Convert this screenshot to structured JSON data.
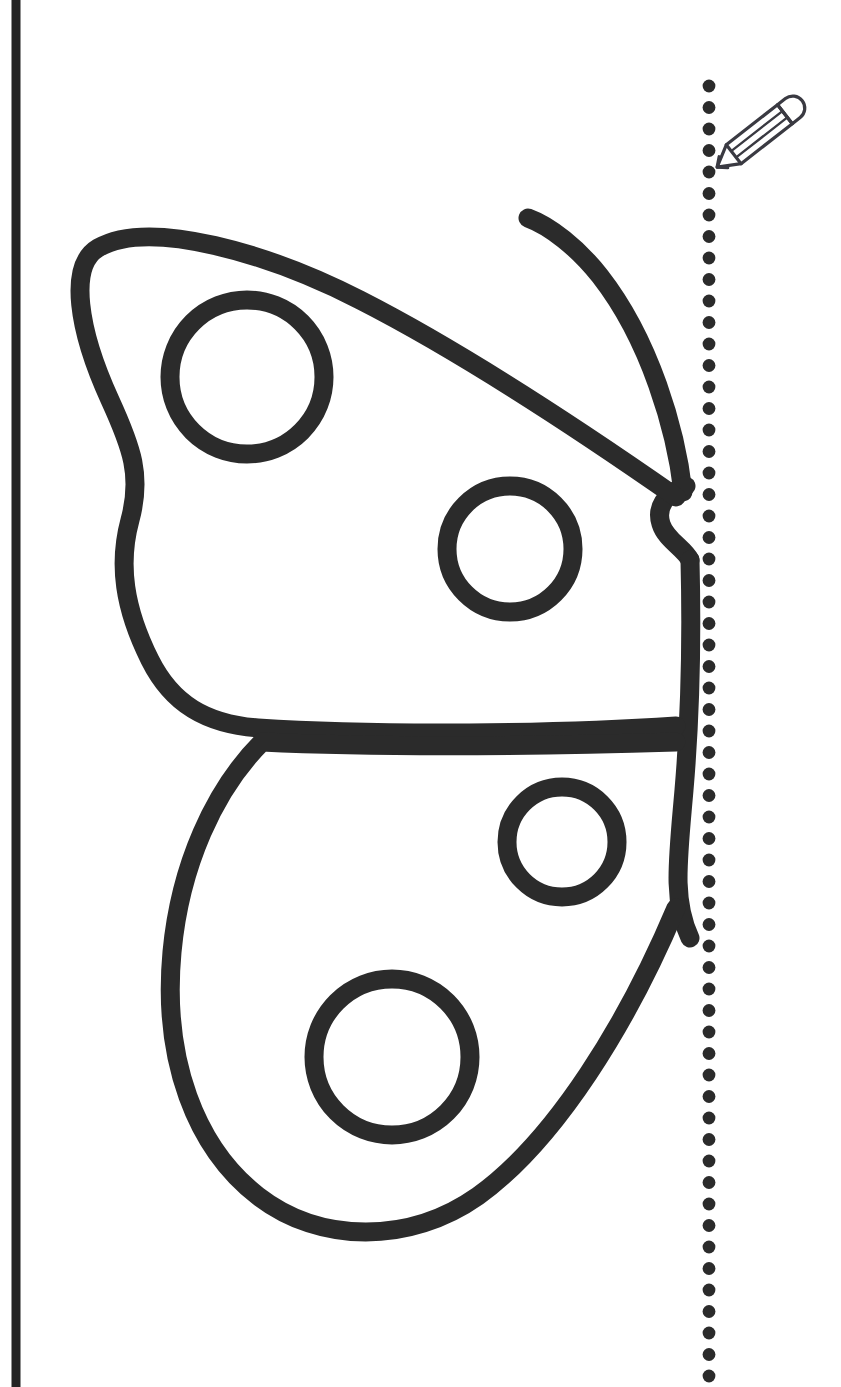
{
  "page": {
    "title": "Butterfly Symmetry Drawing Worksheet",
    "width": 841,
    "height": 1387,
    "background_color": "#ffffff",
    "ink_color": "#2b2b2b",
    "accent_color": "#3a3a42"
  },
  "margin_rule": {
    "name": "left-margin-rule",
    "x": 16,
    "y_start": 0,
    "y_end": 1387,
    "stroke_width": 9,
    "color": "#232323"
  },
  "fold_line": {
    "name": "vertical-dotted-fold-line",
    "label": "fold / mirror line",
    "x": 709,
    "dot_radius": 6.4,
    "dot_spacing": 21.5,
    "y_start": 86,
    "y_end": 1380,
    "color": "#2b2b2b"
  },
  "pencil_icon": {
    "name": "pencil-icon",
    "label": "pencil",
    "x": 730,
    "y": 98,
    "width": 72,
    "height": 62,
    "rotation_deg": -38,
    "color": "#3a3a42"
  },
  "butterfly": {
    "name": "butterfly-half-outline",
    "label": "butterfly (left half)",
    "stroke_width": 19,
    "color": "#2b2b2b",
    "antenna": {
      "name": "antenna",
      "tip": [
        527,
        218
      ],
      "base": [
        683,
        492
      ]
    },
    "body": {
      "name": "butterfly-body",
      "head_y": 500,
      "tail_y": 935
    },
    "upper_wing": {
      "name": "upper-wing",
      "top_edge_start": [
        78,
        262
      ],
      "tip": [
        680,
        500
      ],
      "bottom_edge_y": 726
    },
    "lower_wing": {
      "name": "lower-wing",
      "top_edge_y": 740,
      "bottom_y": 1232
    },
    "spots": [
      {
        "name": "spot-upper-large",
        "cx": 247,
        "cy": 377,
        "r": 77
      },
      {
        "name": "spot-upper-small",
        "cx": 510,
        "cy": 549,
        "r": 63
      },
      {
        "name": "spot-lower-small",
        "cx": 562,
        "cy": 842,
        "r": 55
      },
      {
        "name": "spot-lower-large",
        "cx": 392,
        "cy": 1057,
        "r": 78
      }
    ]
  }
}
